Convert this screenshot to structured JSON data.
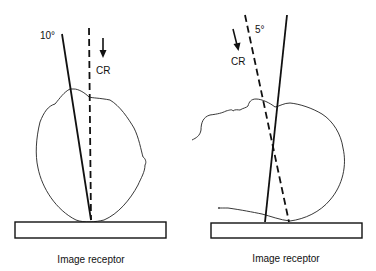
{
  "left_panel": {
    "angle_label": "10°",
    "cr_label": "CR",
    "receptor_label": "Image receptor"
  },
  "right_panel": {
    "angle_label": "5°",
    "cr_label": "CR",
    "receptor_label": "Image receptor"
  },
  "colors": {
    "line": "#111111",
    "background": "#ffffff"
  }
}
